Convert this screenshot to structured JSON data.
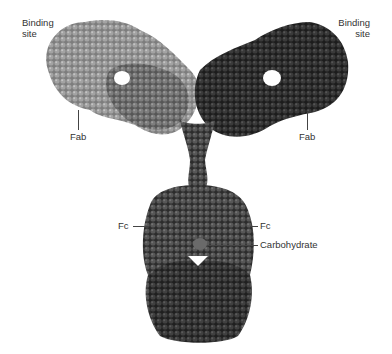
{
  "figure": {
    "labels": {
      "binding_site_left": [
        "Binding",
        "site"
      ],
      "binding_site_right": [
        "Binding",
        "site"
      ],
      "fab_left": "Fab",
      "fab_right": "Fab",
      "fc_left": "Fc",
      "fc_right": "Fc",
      "carbohydrate": "Carbohydrate"
    },
    "colors": {
      "background": "#ffffff",
      "left_heavy_light": "#8a8a8a",
      "left_inner": "#6e6e6e",
      "right_chain": "#2e2e2e",
      "fc_body": "#4a4a4a",
      "fc_dark": "#222222",
      "label_text": "#333333",
      "leader_line": "#444444"
    }
  }
}
